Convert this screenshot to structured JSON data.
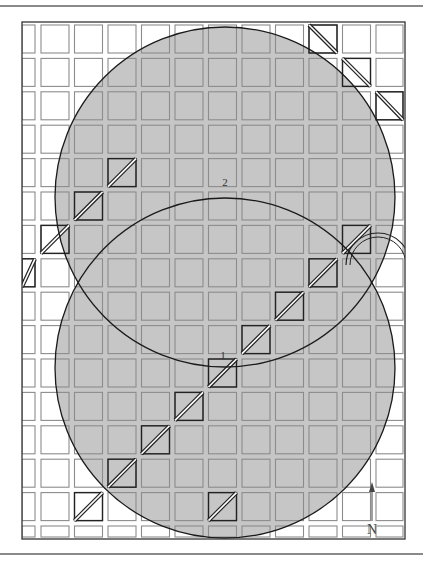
{
  "diagram": {
    "title": "",
    "circles": [
      {
        "label": "1",
        "cx": 225,
        "cy": 368,
        "r": 170
      },
      {
        "label": "2",
        "cx": 225,
        "cy": 197,
        "r": 170
      }
    ],
    "north_label": "N",
    "colors": {
      "fill": "#c6c6c6",
      "cell_border": "#8c8c8c",
      "marked_border": "#222222",
      "circle_stroke": "#1a1a1a",
      "frame": "#333333"
    }
  }
}
